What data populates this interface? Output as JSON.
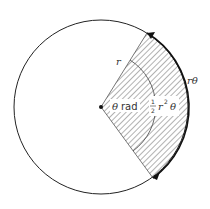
{
  "diagram": {
    "labels": {
      "radius": "r",
      "arc_length": "rθ",
      "angle_symbol": "θ",
      "angle_unit": "rad",
      "area_fraction_num": "1",
      "area_fraction_den": "2",
      "area_r": "r",
      "area_exp": "2",
      "area_theta": "θ"
    },
    "colors": {
      "stroke": "#222222",
      "hatch": "#555555",
      "background": "#ffffff"
    }
  }
}
